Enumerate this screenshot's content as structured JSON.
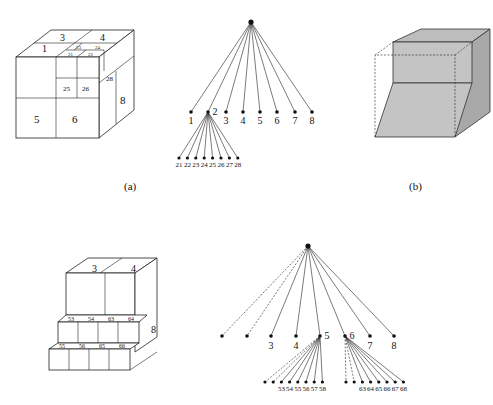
{
  "figure": {
    "panel_a": {
      "caption": "(a)",
      "cube_labels": {
        "top": [
          "3",
          "4"
        ],
        "front_top_left": "1",
        "sub_top": [
          "23",
          "24"
        ],
        "sub_front_top": [
          "21",
          "22"
        ],
        "sub_front": [
          "25",
          "26"
        ],
        "sub_side": "28",
        "front_bottom": [
          "5",
          "6"
        ],
        "side": "8"
      },
      "tree": {
        "children": [
          "1",
          "2",
          "3",
          "4",
          "5",
          "6",
          "7",
          "8"
        ],
        "expanded_child": "2",
        "grandchildren": [
          "21",
          "22",
          "23",
          "24",
          "25",
          "26",
          "27",
          "28"
        ]
      }
    },
    "panel_b": {
      "caption": "(b)",
      "fill_color": "#c8c8c8"
    },
    "panel_c": {
      "cube_labels": {
        "top": [
          "3",
          "4"
        ],
        "side": "8",
        "mid_row": [
          "53",
          "54",
          "63",
          "64"
        ],
        "bottom_row": [
          "55",
          "56",
          "65",
          "66"
        ]
      },
      "tree": {
        "children": [
          "",
          "",
          "3",
          "4",
          "5",
          "6",
          "7",
          "8"
        ],
        "dashed_children": [
          0,
          1
        ],
        "expanded": [
          {
            "child": "5",
            "grandchildren": [
              "",
              "",
              "53",
              "54",
              "55",
              "56",
              "57",
              "58"
            ]
          },
          {
            "child": "6",
            "grandchildren": [
              "",
              "",
              "63",
              "64",
              "65",
              "66",
              "67",
              "68"
            ]
          }
        ]
      }
    }
  }
}
